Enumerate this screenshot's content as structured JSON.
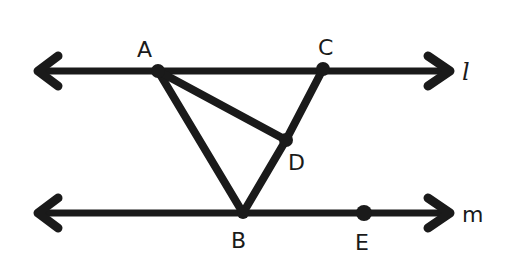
{
  "diagram": {
    "colors": {
      "ink": "#1a1a1a",
      "background": "#ffffff"
    },
    "lines": [
      {
        "name": "l",
        "label": "l",
        "y": 71,
        "x1": 33,
        "x2": 453,
        "label_x": 462,
        "label_y": 80
      },
      {
        "name": "m",
        "label": "m",
        "y": 213,
        "x1": 33,
        "x2": 453,
        "label_x": 462,
        "label_y": 222
      }
    ],
    "points": {
      "A": {
        "label": "A",
        "x": 158,
        "y": 71,
        "label_x": 137,
        "label_y": 57,
        "on": "l"
      },
      "C": {
        "label": "C",
        "x": 323,
        "y": 69,
        "label_x": 318,
        "label_y": 55,
        "on": "l"
      },
      "D": {
        "label": "D",
        "x": 286,
        "y": 140,
        "label_x": 288,
        "label_y": 170
      },
      "B": {
        "label": "B",
        "x": 243,
        "y": 213,
        "label_x": 231,
        "label_y": 248,
        "on": "m"
      },
      "E": {
        "label": "E",
        "x": 364,
        "y": 213,
        "label_x": 355,
        "label_y": 250,
        "on": "m"
      }
    },
    "segments": [
      {
        "name": "AB",
        "from": "A",
        "to": "B"
      },
      {
        "name": "AD",
        "from": "A",
        "to": "D"
      },
      {
        "name": "CD",
        "from": "C",
        "to": "D"
      },
      {
        "name": "DB",
        "from": "D",
        "to": "B"
      }
    ]
  }
}
